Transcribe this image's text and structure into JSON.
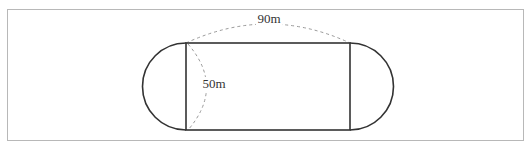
{
  "diagram": {
    "labels": {
      "length": "90m",
      "width": "50m"
    },
    "colors": {
      "stroke": "#333333",
      "dashed": "#999999",
      "frame": "#b8b8b8"
    }
  }
}
